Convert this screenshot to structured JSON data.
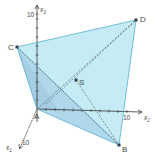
{
  "diagram": {
    "type": "3d-pyramid-coordinate-system",
    "colors": {
      "face_light": "#c9eef7",
      "face_dark": "#9fc8e0",
      "edge": "#5aaed0",
      "axis": "#333333",
      "dashed": "#4a4a4a",
      "label": "#444444"
    },
    "points": {
      "A": {
        "label": "A",
        "x": 37,
        "y": 109
      },
      "B": {
        "label": "B",
        "x": 119,
        "y": 145
      },
      "C": {
        "label": "C",
        "x": 17,
        "y": 47
      },
      "D": {
        "label": "D",
        "x": 136,
        "y": 20
      },
      "S": {
        "label": "S",
        "x": 76,
        "y": 80
      }
    },
    "axes": {
      "x1": {
        "name": "x",
        "sub": "1",
        "tick": "10"
      },
      "x2": {
        "name": "x",
        "sub": "2",
        "tick": "10"
      },
      "x3": {
        "name": "x",
        "sub": "3",
        "tick": "10"
      }
    }
  }
}
